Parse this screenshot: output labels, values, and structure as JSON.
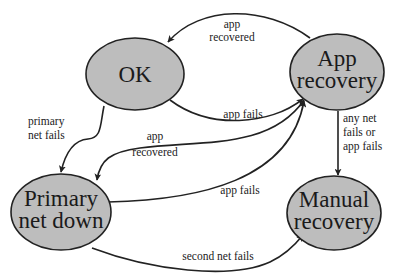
{
  "diagram": {
    "type": "state-diagram",
    "colors": {
      "node_fill": "#bdbdbd",
      "stroke": "#222222",
      "background": "#ffffff"
    },
    "nodes": [
      {
        "id": "ok",
        "lines": [
          "OK"
        ]
      },
      {
        "id": "app_recovery",
        "lines": [
          "App",
          "recovery"
        ]
      },
      {
        "id": "primary_net_down",
        "lines": [
          "Primary",
          "net down"
        ]
      },
      {
        "id": "manual_recovery",
        "lines": [
          "Manual",
          "recovery"
        ]
      }
    ],
    "edges": [
      {
        "from": "app_recovery",
        "to": "ok",
        "lines": [
          "app",
          "recovered"
        ]
      },
      {
        "from": "ok",
        "to": "app_recovery",
        "lines": [
          "app fails"
        ]
      },
      {
        "from": "ok",
        "to": "primary_net_down",
        "lines": [
          "primary",
          "net fails"
        ]
      },
      {
        "from": "app_recovery",
        "to": "primary_net_down",
        "lines": [
          "app",
          "recovered"
        ]
      },
      {
        "from": "primary_net_down",
        "to": "app_recovery",
        "lines": [
          "app fails"
        ]
      },
      {
        "from": "app_recovery",
        "to": "manual_recovery",
        "lines": [
          "any net",
          "fails or",
          "app fails"
        ]
      },
      {
        "from": "primary_net_down",
        "to": "manual_recovery",
        "lines": [
          "second net fails"
        ]
      }
    ]
  }
}
